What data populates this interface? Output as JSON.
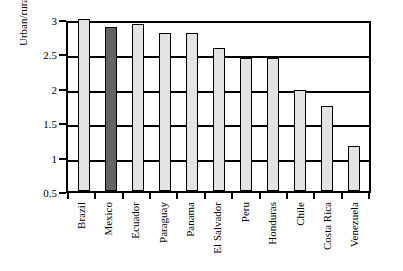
{
  "chart_data": {
    "type": "bar",
    "title": "",
    "xlabel": "",
    "ylabel": "Urban/rural income",
    "ylim": [
      0.5,
      3.0
    ],
    "yticks": [
      "0.5",
      "1",
      "1.5",
      "2",
      "2.5",
      "3"
    ],
    "ytick_values": [
      0.5,
      1,
      1.5,
      2,
      2.5,
      3
    ],
    "grid": true,
    "legend": "none",
    "categories": [
      "Brazil",
      "Mexico",
      "Ecuador",
      "Paraguay",
      "Panama",
      "El Salvador",
      "Peru",
      "Honduras",
      "Chile",
      "Costa Rica",
      "Venezuela"
    ],
    "values": [
      3.0,
      2.89,
      2.93,
      2.79,
      2.79,
      2.58,
      2.44,
      2.44,
      1.97,
      1.74,
      1.16
    ],
    "bar_colors": [
      "#e3e3e3",
      "#636363",
      "#e3e3e3",
      "#e3e3e3",
      "#e3e3e3",
      "#e3e3e3",
      "#e3e3e3",
      "#e3e3e3",
      "#e3e3e3",
      "#e3e3e3",
      "#e3e3e3"
    ],
    "highlight_category": "Mexico",
    "colors": {
      "bar_fill": "#e3e3e3",
      "bar_highlight_fill": "#636363",
      "bar_edge": "#000000",
      "axis": "#000000",
      "grid": "#000000",
      "background": "#ffffff"
    }
  }
}
